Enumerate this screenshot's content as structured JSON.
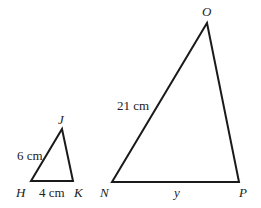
{
  "diagram": {
    "type": "similar-triangles",
    "triangles": [
      {
        "name": "HJK",
        "vertices": {
          "H": {
            "label": "H",
            "x": 31,
            "y": 181
          },
          "K": {
            "label": "K",
            "x": 73,
            "y": 181
          },
          "J": {
            "label": "J",
            "x": 62,
            "y": 129
          }
        },
        "sides": {
          "HJ": "6 cm",
          "HK": "4 cm"
        }
      },
      {
        "name": "NOP",
        "vertices": {
          "N": {
            "label": "N",
            "x": 112,
            "y": 182
          },
          "P": {
            "label": "P",
            "x": 239,
            "y": 182
          },
          "O": {
            "label": "O",
            "x": 207,
            "y": 23
          }
        },
        "sides": {
          "NO": "21 cm",
          "NP": "y"
        }
      }
    ],
    "stroke_color": "#1a1a1a",
    "label_color": "#222222"
  }
}
